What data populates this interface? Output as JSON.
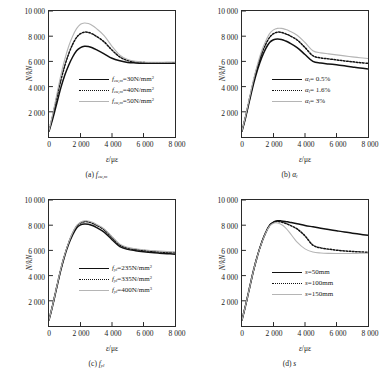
{
  "figure": {
    "axis": {
      "ylabel": "N/kN",
      "xlabel_symbol": "ε",
      "xlabel_unit": "με",
      "yticks": [
        "2 000",
        "4 000",
        "6 000",
        "8 000",
        "10 000"
      ],
      "xticks": [
        "0",
        "2 000",
        "4 000",
        "6 000",
        "8 000"
      ]
    },
    "colors": {
      "series1": "#111111",
      "series2": "#111111",
      "series3": "#b5b5b5",
      "axis": "#2a2a2a",
      "background": "#ffffff"
    }
  },
  "chart_data": [
    {
      "id": "a",
      "type": "line",
      "title": "(a) f_cu,m",
      "caption_prefix": "(a)",
      "caption_symbol": "f",
      "caption_sub": "cu,m",
      "xlabel": "ε/με",
      "ylabel": "N/kN",
      "xlim": [
        0,
        8000
      ],
      "ylim": [
        0,
        10000
      ],
      "grid": false,
      "legend_position": "center-left",
      "x": [
        0,
        250,
        500,
        750,
        1000,
        1250,
        1500,
        1750,
        2000,
        2250,
        2500,
        2750,
        3000,
        3500,
        4000,
        4500,
        5000,
        5500,
        6000,
        6500,
        7000,
        7500,
        8000
      ],
      "series": [
        {
          "name": "f_cu,m=30N/mm2",
          "label_symbol": "f",
          "label_sub": "cu,m",
          "label_value": "=30N/mm",
          "label_sup": "2",
          "style": "solid",
          "color": "#111111",
          "values": [
            450,
            1500,
            2700,
            3900,
            4900,
            5700,
            6350,
            6850,
            7100,
            7200,
            7180,
            7080,
            6930,
            6600,
            6250,
            6050,
            5920,
            5880,
            5860,
            5850,
            5850,
            5850,
            5850
          ]
        },
        {
          "name": "f_cu,m=40N/mm2",
          "label_symbol": "f",
          "label_sub": "cu,m",
          "label_value": "=40N/mm",
          "label_sup": "2",
          "style": "dotted",
          "color": "#111111",
          "values": [
            480,
            1750,
            3150,
            4500,
            5650,
            6600,
            7350,
            7900,
            8200,
            8320,
            8300,
            8180,
            8000,
            7550,
            6900,
            6350,
            6070,
            5960,
            5910,
            5890,
            5890,
            5900,
            5900
          ]
        },
        {
          "name": "f_cu,m=50N/mm2",
          "label_symbol": "f",
          "label_sub": "cu,m",
          "label_value": "=50N/mm",
          "label_sup": "2",
          "style": "gray",
          "color": "#b5b5b5",
          "values": [
            500,
            1900,
            3400,
            4900,
            6150,
            7200,
            8000,
            8600,
            8950,
            9050,
            9000,
            8850,
            8620,
            8050,
            7200,
            6500,
            6150,
            6000,
            5950,
            5930,
            5930,
            5940,
            5950
          ]
        }
      ]
    },
    {
      "id": "b",
      "type": "line",
      "title": "(b) α_l",
      "caption_prefix": "(b)",
      "caption_symbol": "α",
      "caption_sub": "l",
      "xlabel": "ε/με",
      "ylabel": "N/kN",
      "xlim": [
        0,
        8000
      ],
      "ylim": [
        0,
        10000
      ],
      "grid": false,
      "legend_position": "center-left",
      "x": [
        0,
        250,
        500,
        750,
        1000,
        1250,
        1500,
        1750,
        2000,
        2250,
        2500,
        2750,
        3000,
        3500,
        4000,
        4500,
        5000,
        5500,
        6000,
        6500,
        7000,
        7500,
        8000
      ],
      "series": [
        {
          "name": "α_l= 0.5%",
          "label_symbol": "α",
          "label_sub": "l",
          "label_value": "= 0.5%",
          "label_sup": "",
          "style": "solid",
          "color": "#111111",
          "values": [
            460,
            1650,
            3000,
            4300,
            5400,
            6300,
            7000,
            7500,
            7720,
            7780,
            7740,
            7630,
            7480,
            7100,
            6550,
            6000,
            5870,
            5800,
            5730,
            5650,
            5560,
            5470,
            5400
          ]
        },
        {
          "name": "α_l= 1.6%",
          "label_symbol": "α",
          "label_sub": "l",
          "label_value": "= 1.6%",
          "label_sup": "",
          "style": "dotted",
          "color": "#111111",
          "values": [
            480,
            1750,
            3150,
            4500,
            5650,
            6600,
            7350,
            7900,
            8200,
            8320,
            8300,
            8200,
            8060,
            7700,
            7100,
            6450,
            6280,
            6200,
            6120,
            6040,
            5970,
            5900,
            5850
          ]
        },
        {
          "name": "α_l= 3%",
          "label_symbol": "α",
          "label_sub": "l",
          "label_value": "= 3%",
          "label_sup": "",
          "style": "gray",
          "color": "#b5b5b5",
          "values": [
            490,
            1800,
            3250,
            4650,
            5850,
            6850,
            7600,
            8200,
            8500,
            8620,
            8620,
            8540,
            8420,
            8080,
            7500,
            6850,
            6680,
            6600,
            6520,
            6440,
            6360,
            6290,
            6230
          ]
        }
      ]
    },
    {
      "id": "c",
      "type": "line",
      "title": "(c) f_yl",
      "caption_prefix": "(c)",
      "caption_symbol": "f",
      "caption_sub": "yl",
      "xlabel": "ε/με",
      "ylabel": "N/kN",
      "xlim": [
        0,
        8000
      ],
      "ylim": [
        0,
        10000
      ],
      "grid": false,
      "legend_position": "center-left",
      "x": [
        0,
        250,
        500,
        750,
        1000,
        1250,
        1500,
        1750,
        2000,
        2250,
        2500,
        2750,
        3000,
        3500,
        4000,
        4500,
        5000,
        5500,
        6000,
        6500,
        7000,
        7500,
        8000
      ],
      "series": [
        {
          "name": "f_yl=235N/mm2",
          "label_symbol": "f",
          "label_sub": "yl",
          "label_value": "=235N/mm",
          "label_sup": "2",
          "style": "solid",
          "color": "#111111",
          "values": [
            470,
            1720,
            3100,
            4430,
            5570,
            6500,
            7230,
            7780,
            8030,
            8100,
            8080,
            7980,
            7830,
            7450,
            6850,
            6300,
            6080,
            5980,
            5900,
            5830,
            5780,
            5740,
            5700
          ]
        },
        {
          "name": "f_yl=335N/mm2",
          "label_symbol": "f",
          "label_sub": "yl",
          "label_value": "=335N/mm",
          "label_sup": "2",
          "style": "dotted",
          "color": "#111111",
          "values": [
            480,
            1750,
            3150,
            4500,
            5650,
            6600,
            7350,
            7900,
            8180,
            8280,
            8260,
            8160,
            8010,
            7640,
            7030,
            6430,
            6180,
            6070,
            5990,
            5930,
            5880,
            5840,
            5820
          ]
        },
        {
          "name": "f_yl=400N/mm2",
          "label_symbol": "f",
          "label_sub": "yl",
          "label_value": "=400N/mm",
          "label_sup": "3",
          "style": "gray",
          "color": "#b5b5b5",
          "values": [
            485,
            1765,
            3175,
            4535,
            5690,
            6640,
            7400,
            7960,
            8240,
            8350,
            8330,
            8230,
            8080,
            7710,
            7100,
            6500,
            6240,
            6130,
            6050,
            5990,
            5940,
            5900,
            5880
          ]
        }
      ]
    },
    {
      "id": "d",
      "type": "line",
      "title": "(d) s",
      "caption_prefix": "(d)",
      "caption_symbol": "s",
      "caption_sub": "",
      "xlabel": "ε/με",
      "ylabel": "N/kN",
      "xlim": [
        0,
        8000
      ],
      "ylim": [
        0,
        10000
      ],
      "grid": false,
      "legend_position": "center-left",
      "x": [
        0,
        250,
        500,
        750,
        1000,
        1250,
        1500,
        1750,
        2000,
        2250,
        2500,
        2750,
        3000,
        3500,
        4000,
        4500,
        5000,
        5500,
        6000,
        6500,
        7000,
        7500,
        8000
      ],
      "series": [
        {
          "name": "s=50mm",
          "label_symbol": "s",
          "label_sub": "",
          "label_value": "=50mm",
          "label_sup": "",
          "style": "solid",
          "color": "#111111",
          "values": [
            480,
            1750,
            3150,
            4500,
            5650,
            6620,
            7400,
            7980,
            8250,
            8350,
            8340,
            8300,
            8240,
            8120,
            7980,
            7870,
            7760,
            7660,
            7560,
            7460,
            7370,
            7280,
            7200
          ]
        },
        {
          "name": "s=100mm",
          "label_symbol": "s",
          "label_sub": "",
          "label_value": "=100mm",
          "label_sup": "",
          "style": "dotted",
          "color": "#111111",
          "values": [
            480,
            1750,
            3150,
            4500,
            5650,
            6620,
            7400,
            7980,
            8230,
            8300,
            8250,
            8150,
            8020,
            7700,
            7150,
            6420,
            6200,
            6100,
            6020,
            5960,
            5920,
            5880,
            5850
          ]
        },
        {
          "name": "s=150mm",
          "label_symbol": "s",
          "label_sub": "",
          "label_value": "=150mm",
          "label_sup": "",
          "style": "gray",
          "color": "#b5b5b5",
          "values": [
            480,
            1750,
            3150,
            4500,
            5640,
            6600,
            7370,
            7930,
            8160,
            8180,
            8050,
            7800,
            7450,
            6650,
            6120,
            5870,
            5790,
            5760,
            5750,
            5750,
            5760,
            5770,
            5780
          ]
        }
      ]
    }
  ]
}
